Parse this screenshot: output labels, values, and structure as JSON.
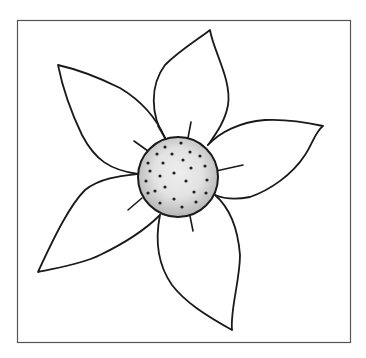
{
  "image": {
    "subject": "Line drawing of a five-petal flower with a shaded, dotted center inside a square frame",
    "colors": {
      "background": "#ffffff",
      "stroke": "#1a1a1a",
      "frame": "#555555",
      "center_fill": "#cfcfcf",
      "center_highlight": "#ececec",
      "dots": "#222222"
    },
    "petal_count": 5,
    "center_dot_count": 26
  }
}
